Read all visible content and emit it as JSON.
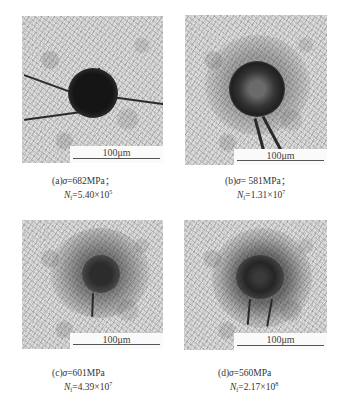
{
  "figure": {
    "panels": [
      {
        "id": "a",
        "label": "(a)",
        "sigma_symbol": "σ",
        "stress": "=682MPa；",
        "nf_symbol": "N",
        "nf_sub": "f",
        "nf_value": "=5.40×10",
        "nf_exp": "5",
        "scale_bar": "100μm"
      },
      {
        "id": "b",
        "label": "(b)",
        "sigma_symbol": "σ",
        "stress": "= 581MPa；",
        "nf_symbol": "N",
        "nf_sub": "f",
        "nf_value": "=1.31×10",
        "nf_exp": "7",
        "scale_bar": "100μm"
      },
      {
        "id": "c",
        "label": "(c)",
        "sigma_symbol": "σ",
        "stress": "=601MPa",
        "nf_symbol": "N",
        "nf_sub": "f",
        "nf_value": "=4.39×10",
        "nf_exp": "7",
        "scale_bar": "100μm"
      },
      {
        "id": "d",
        "label": "(d)",
        "sigma_symbol": "σ",
        "stress": "=560MPa",
        "nf_symbol": "N",
        "nf_sub": "f",
        "nf_value": "=2.17×10",
        "nf_exp": "8",
        "scale_bar": "100μm"
      }
    ]
  }
}
